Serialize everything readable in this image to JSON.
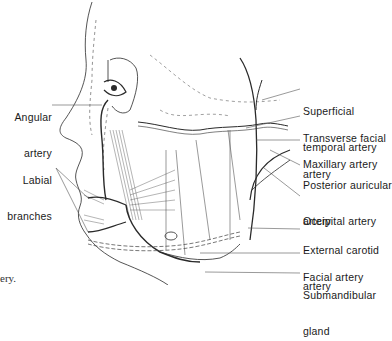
{
  "figure": {
    "left_labels": [
      {
        "id": "angular-artery",
        "line1": "Angular",
        "line2": "artery"
      },
      {
        "id": "labial-branches",
        "line1": "Labial",
        "line2": "branches"
      }
    ],
    "right_labels": [
      {
        "id": "superficial-temporal-artery",
        "line1": "Superficial",
        "line2": "temporal artery"
      },
      {
        "id": "transverse-facial-artery",
        "line1": "Transverse facial",
        "line2": "artery"
      },
      {
        "id": "maxillary-artery",
        "line1": "Maxillary artery",
        "line2": ""
      },
      {
        "id": "posterior-auricular-artery",
        "line1": "Posterior auricular",
        "line2": "artery"
      },
      {
        "id": "occipital-artery",
        "line1": "Occipital artery",
        "line2": ""
      },
      {
        "id": "external-carotid-artery",
        "line1": "External carotid",
        "line2": "artery"
      },
      {
        "id": "facial-artery",
        "line1": "Facial artery",
        "line2": ""
      },
      {
        "id": "submandibular-gland",
        "line1": "Submandibular",
        "line2": "gland"
      }
    ],
    "caption_fragment": "ery."
  }
}
